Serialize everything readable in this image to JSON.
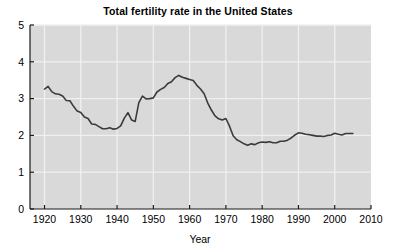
{
  "chart_data": {
    "type": "line",
    "title": "Total fertility rate in the United States",
    "xlabel": "Year",
    "ylabel": "",
    "xlim": [
      1916,
      2010
    ],
    "ylim": [
      0,
      5
    ],
    "xticks": [
      1920,
      1930,
      1940,
      1950,
      1960,
      1970,
      1980,
      1990,
      2000,
      2010
    ],
    "yticks": [
      0,
      1,
      2,
      3,
      4,
      5
    ],
    "grid": true,
    "legend": null,
    "series": [
      {
        "name": "Total fertility rate",
        "color": "#3b3b3b",
        "x": [
          1920,
          1921,
          1922,
          1923,
          1924,
          1925,
          1926,
          1927,
          1928,
          1929,
          1930,
          1931,
          1932,
          1933,
          1934,
          1935,
          1936,
          1937,
          1938,
          1939,
          1940,
          1941,
          1942,
          1943,
          1944,
          1945,
          1946,
          1947,
          1948,
          1949,
          1950,
          1951,
          1952,
          1953,
          1954,
          1955,
          1956,
          1957,
          1958,
          1959,
          1960,
          1961,
          1962,
          1963,
          1964,
          1965,
          1966,
          1967,
          1968,
          1969,
          1970,
          1971,
          1972,
          1973,
          1974,
          1975,
          1976,
          1977,
          1978,
          1979,
          1980,
          1981,
          1982,
          1983,
          1984,
          1985,
          1986,
          1987,
          1988,
          1989,
          1990,
          1991,
          1992,
          1993,
          1994,
          1995,
          1996,
          1997,
          1998,
          1999,
          2000,
          2001,
          2002,
          2003,
          2004,
          2005
        ],
        "y": [
          3.26,
          3.33,
          3.19,
          3.13,
          3.12,
          3.07,
          2.95,
          2.94,
          2.79,
          2.66,
          2.62,
          2.5,
          2.46,
          2.31,
          2.3,
          2.24,
          2.18,
          2.18,
          2.21,
          2.17,
          2.19,
          2.26,
          2.47,
          2.62,
          2.42,
          2.38,
          2.89,
          3.07,
          2.99,
          3.0,
          3.02,
          3.18,
          3.25,
          3.3,
          3.41,
          3.46,
          3.57,
          3.63,
          3.58,
          3.55,
          3.52,
          3.49,
          3.36,
          3.26,
          3.13,
          2.88,
          2.69,
          2.53,
          2.45,
          2.42,
          2.46,
          2.25,
          1.99,
          1.88,
          1.83,
          1.77,
          1.73,
          1.77,
          1.75,
          1.8,
          1.82,
          1.81,
          1.83,
          1.8,
          1.8,
          1.84,
          1.84,
          1.87,
          1.93,
          2.01,
          2.07,
          2.06,
          2.03,
          2.02,
          2.0,
          1.98,
          1.98,
          1.97,
          2.0,
          2.01,
          2.06,
          2.03,
          2.01,
          2.05,
          2.05,
          2.05
        ]
      }
    ]
  },
  "axes": {
    "x_tick_labels": [
      "1920",
      "1930",
      "1940",
      "1950",
      "1960",
      "1970",
      "1980",
      "1990",
      "2000",
      "2010"
    ],
    "y_tick_labels": [
      "0",
      "1",
      "2",
      "3",
      "4",
      "5"
    ],
    "x_axis_title": "Year"
  },
  "style": {
    "plot_background": "#d9d9d9",
    "grid_color": "#f0f0f0",
    "line_color": "#3b3b3b",
    "axis_color": "#1a1a1a",
    "page_background": "#ffffff"
  }
}
